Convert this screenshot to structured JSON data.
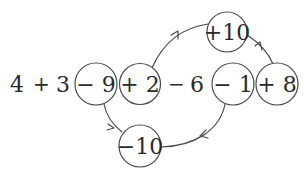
{
  "diagram": {
    "expression": {
      "tokens": [
        {
          "text": "4",
          "kind": "number"
        },
        {
          "text": "+",
          "kind": "operator"
        },
        {
          "text": "3",
          "kind": "number"
        },
        {
          "text": "− 9",
          "kind": "circled",
          "group": "A"
        },
        {
          "text": "+ 2",
          "kind": "circled",
          "group": "B"
        },
        {
          "text": "−",
          "kind": "operator"
        },
        {
          "text": "6",
          "kind": "number"
        },
        {
          "text": "− 1",
          "kind": "circled",
          "group": "A"
        },
        {
          "text": "+ 8",
          "kind": "circled",
          "group": "B"
        }
      ]
    },
    "results": {
      "top": {
        "text": "+10",
        "from": [
          "+ 2",
          "+ 8"
        ]
      },
      "bottom": {
        "text": "−10",
        "from": [
          "− 9",
          "− 1"
        ]
      }
    },
    "edges": [
      {
        "from": "+ 2",
        "to": "+10"
      },
      {
        "from": "+ 8",
        "to": "+10"
      },
      {
        "from": "− 9",
        "to": "−10"
      },
      {
        "from": "− 1",
        "to": "−10"
      }
    ],
    "colors": {
      "stroke": "#4a4a4a",
      "text": "#2a2a2a",
      "background": "#ffffff"
    }
  }
}
